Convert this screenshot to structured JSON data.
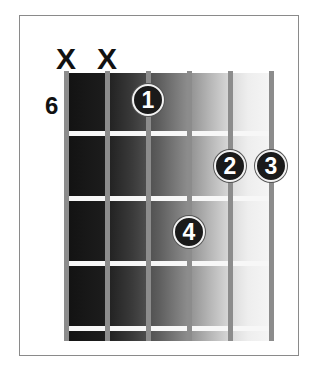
{
  "diagram": {
    "type": "guitar-chord-chart",
    "starting_fret_label": "6",
    "strings": 6,
    "frets_shown": 4,
    "muted_strings": [
      {
        "string": 6,
        "label": "X"
      },
      {
        "string": 5,
        "label": "X"
      }
    ],
    "fingers": [
      {
        "finger": "1",
        "string": 4,
        "fret": 1
      },
      {
        "finger": "2",
        "string": 2,
        "fret": 2
      },
      {
        "finger": "3",
        "string": 1,
        "fret": 2
      },
      {
        "finger": "4",
        "string": 3,
        "fret": 3
      }
    ],
    "colors": {
      "frame": "#8a8a8a",
      "string": "#8c8c8c",
      "fret": "#f7f7f7",
      "dot_fill": "#1a1a1a",
      "dot_text": "#ffffff",
      "gradient_start": "#121212",
      "gradient_end": "#f6f6f6"
    }
  }
}
